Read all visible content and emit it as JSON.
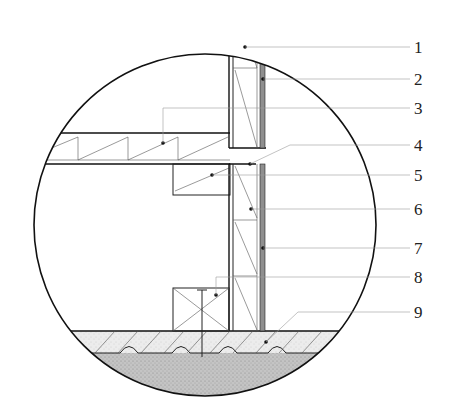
{
  "diagram": {
    "callouts": [
      {
        "number": "1",
        "target": "upper-wall-stud"
      },
      {
        "number": "2",
        "target": "upper-exterior-cladding"
      },
      {
        "number": "3",
        "target": "floor-joist"
      },
      {
        "number": "4",
        "target": "sill-gap"
      },
      {
        "number": "5",
        "target": "ledger-beam"
      },
      {
        "number": "6",
        "target": "lower-wall-stud"
      },
      {
        "number": "7",
        "target": "lower-exterior-cladding"
      },
      {
        "number": "8",
        "target": "sole-plate-with-anchor"
      },
      {
        "number": "9",
        "target": "concrete-slab-foundation"
      }
    ],
    "colors": {
      "line": "#111111",
      "leader": "#9a9a9a",
      "cladding": "#8f8f8f",
      "concrete": "#e4e4e4",
      "soil": "#b8b8b8"
    }
  }
}
